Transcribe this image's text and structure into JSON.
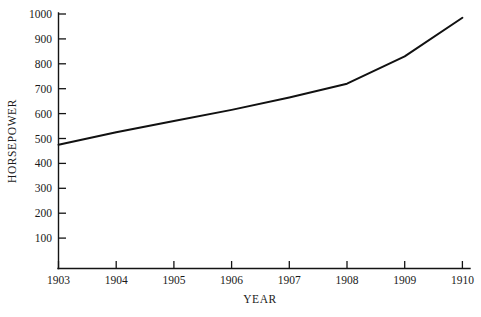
{
  "chart_data": {
    "type": "line",
    "title": "",
    "xlabel": "YEAR",
    "ylabel": "HORSEPOWER",
    "x": [
      1903,
      1904,
      1905,
      1906,
      1907,
      1908,
      1909,
      1910
    ],
    "values": [
      475,
      525,
      570,
      615,
      665,
      720,
      830,
      985
    ],
    "series": [
      {
        "name": "Horsepower",
        "values": [
          475,
          525,
          570,
          615,
          665,
          720,
          830,
          985
        ]
      }
    ],
    "xlim": [
      1903,
      1910
    ],
    "ylim": [
      0,
      1000
    ],
    "xticks": [
      "1903",
      "1904",
      "1905",
      "1906",
      "1907",
      "1908",
      "1909",
      "1910"
    ],
    "yticks": [
      "100",
      "200",
      "300",
      "400",
      "500",
      "600",
      "700",
      "800",
      "900",
      "1000"
    ],
    "grid": false,
    "legend": false,
    "line_color": "#111111",
    "axis_color": "#141414",
    "background": "#ffffff"
  }
}
